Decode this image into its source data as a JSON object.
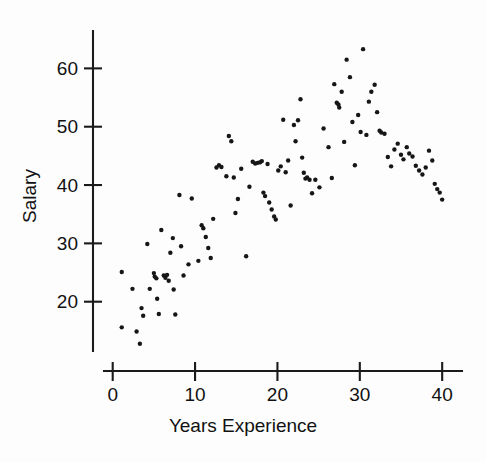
{
  "chart_data": {
    "type": "scatter",
    "title": "",
    "xlabel": "Years Experience",
    "ylabel": "Salary",
    "xlim": [
      -1.5,
      42
    ],
    "ylim": [
      10.5,
      66
    ],
    "xticks": [
      0,
      10,
      20,
      30,
      40
    ],
    "yticks": [
      20,
      30,
      40,
      50,
      60
    ],
    "xtick_labels": [
      "0",
      "10",
      "20",
      "30",
      "40"
    ],
    "ytick_labels": [
      "20",
      "30",
      "40",
      "50",
      "60"
    ],
    "grid": false,
    "legend": false,
    "marker": "filled-circle",
    "marker_color": "#161616",
    "marker_size": 4.4,
    "n_points": 120,
    "series": [
      {
        "name": "observations",
        "points": [
          [
            1.1,
            25.1
          ],
          [
            1.1,
            15.6
          ],
          [
            2.4,
            22.2
          ],
          [
            2.9,
            14.9
          ],
          [
            3.3,
            12.8
          ],
          [
            3.5,
            18.9
          ],
          [
            3.7,
            17.6
          ],
          [
            4.2,
            29.9
          ],
          [
            4.5,
            22.2
          ],
          [
            5.0,
            24.9
          ],
          [
            5.1,
            24.3
          ],
          [
            5.3,
            24.0
          ],
          [
            5.4,
            20.5
          ],
          [
            5.6,
            17.9
          ],
          [
            5.9,
            32.3
          ],
          [
            6.2,
            24.5
          ],
          [
            6.4,
            24.1
          ],
          [
            6.6,
            24.6
          ],
          [
            6.8,
            23.6
          ],
          [
            7.0,
            28.4
          ],
          [
            7.3,
            30.9
          ],
          [
            7.4,
            22.1
          ],
          [
            7.6,
            17.8
          ],
          [
            8.1,
            38.3
          ],
          [
            8.3,
            29.5
          ],
          [
            8.6,
            24.5
          ],
          [
            9.2,
            26.4
          ],
          [
            9.6,
            37.7
          ],
          [
            10.4,
            27.0
          ],
          [
            10.8,
            33.1
          ],
          [
            11.0,
            32.6
          ],
          [
            11.3,
            31.1
          ],
          [
            11.6,
            29.2
          ],
          [
            11.9,
            27.5
          ],
          [
            12.2,
            34.2
          ],
          [
            12.6,
            43.0
          ],
          [
            12.9,
            43.4
          ],
          [
            13.2,
            43.1
          ],
          [
            13.8,
            41.5
          ],
          [
            14.1,
            48.4
          ],
          [
            14.4,
            47.5
          ],
          [
            14.7,
            41.3
          ],
          [
            14.9,
            35.2
          ],
          [
            15.2,
            37.6
          ],
          [
            15.6,
            42.8
          ],
          [
            16.2,
            27.8
          ],
          [
            16.6,
            39.7
          ],
          [
            17.0,
            44.0
          ],
          [
            17.3,
            43.7
          ],
          [
            17.6,
            43.8
          ],
          [
            17.9,
            43.9
          ],
          [
            18.1,
            44.1
          ],
          [
            18.3,
            38.7
          ],
          [
            18.5,
            38.1
          ],
          [
            18.8,
            43.6
          ],
          [
            19.0,
            37.0
          ],
          [
            19.3,
            35.8
          ],
          [
            19.6,
            34.6
          ],
          [
            19.8,
            34.1
          ],
          [
            20.1,
            42.5
          ],
          [
            20.4,
            43.2
          ],
          [
            20.7,
            51.2
          ],
          [
            21.0,
            42.2
          ],
          [
            21.3,
            44.2
          ],
          [
            21.6,
            36.5
          ],
          [
            22.0,
            50.3
          ],
          [
            22.2,
            47.5
          ],
          [
            22.5,
            51.1
          ],
          [
            22.8,
            54.7
          ],
          [
            23.0,
            44.7
          ],
          [
            23.2,
            42.1
          ],
          [
            23.4,
            41.1
          ],
          [
            23.6,
            41.3
          ],
          [
            23.9,
            40.9
          ],
          [
            24.2,
            38.6
          ],
          [
            24.6,
            40.9
          ],
          [
            25.1,
            39.6
          ],
          [
            25.6,
            49.7
          ],
          [
            26.2,
            46.5
          ],
          [
            26.6,
            41.2
          ],
          [
            26.9,
            57.3
          ],
          [
            27.2,
            54.1
          ],
          [
            27.4,
            53.8
          ],
          [
            27.5,
            53.3
          ],
          [
            27.8,
            56.0
          ],
          [
            28.1,
            47.4
          ],
          [
            28.4,
            61.5
          ],
          [
            28.8,
            58.5
          ],
          [
            29.1,
            50.8
          ],
          [
            29.4,
            43.4
          ],
          [
            29.8,
            52.0
          ],
          [
            30.1,
            49.1
          ],
          [
            30.4,
            63.3
          ],
          [
            30.8,
            48.6
          ],
          [
            31.1,
            54.3
          ],
          [
            31.4,
            56.0
          ],
          [
            31.8,
            57.2
          ],
          [
            32.1,
            52.5
          ],
          [
            32.4,
            49.3
          ],
          [
            32.6,
            49.0
          ],
          [
            33.0,
            48.8
          ],
          [
            33.4,
            44.8
          ],
          [
            33.8,
            43.2
          ],
          [
            34.2,
            46.1
          ],
          [
            34.6,
            47.1
          ],
          [
            35.0,
            45.2
          ],
          [
            35.3,
            44.4
          ],
          [
            35.7,
            46.5
          ],
          [
            36.0,
            45.4
          ],
          [
            36.4,
            44.9
          ],
          [
            36.8,
            43.3
          ],
          [
            37.2,
            42.5
          ],
          [
            37.6,
            41.8
          ],
          [
            38.0,
            43.0
          ],
          [
            38.4,
            45.9
          ],
          [
            38.8,
            44.2
          ],
          [
            39.1,
            40.2
          ],
          [
            39.4,
            39.3
          ],
          [
            39.7,
            38.7
          ],
          [
            40.0,
            37.5
          ]
        ]
      }
    ]
  },
  "axes": {
    "x_axis_name": "Years Experience",
    "y_axis_name": "Salary"
  }
}
